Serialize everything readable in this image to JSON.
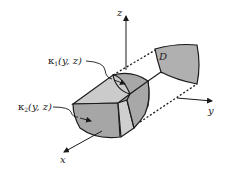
{
  "diagram": {
    "axes": {
      "x_label": "x",
      "y_label": "y",
      "z_label": "z"
    },
    "region_label": "D",
    "labels": {
      "kappa1": {
        "symbol": "κ",
        "subscript": "1",
        "args": "(y, z)"
      },
      "kappa2": {
        "symbol": "κ",
        "subscript": "2",
        "args": "(y, z)"
      }
    },
    "colors": {
      "dark_fill": "#a8a8a8",
      "light_fill": "#c9c9c9",
      "stroke": "#1a1a1a",
      "background": "#ffffff"
    }
  }
}
